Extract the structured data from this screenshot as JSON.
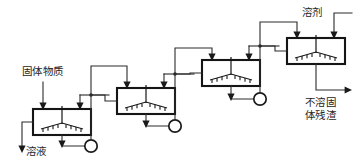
{
  "diagram": {
    "type": "process-flow-diagram",
    "background_color": "#ffffff",
    "line_color": "#2b2b2b",
    "vessel_stroke_color": "#151515",
    "text_color": "#242424",
    "labels": [
      {
        "id": "solid-feed",
        "text": "固体物质",
        "meaning": "solid material feed",
        "x": 22,
        "y": 72,
        "align": "left"
      },
      {
        "id": "solution-out",
        "text": "溶液",
        "meaning": "solution outlet",
        "x": 26,
        "y": 152,
        "align": "left"
      },
      {
        "id": "solvent-in",
        "text": "溶剂",
        "meaning": "solvent inlet",
        "x": 302,
        "y": 15,
        "align": "left"
      },
      {
        "id": "residue-out-line1",
        "text": "不溶固",
        "meaning": "insoluble solid",
        "x": 305,
        "y": 102,
        "align": "left"
      },
      {
        "id": "residue-out-line2",
        "text": "体残渣",
        "meaning": "residue",
        "x": 305,
        "y": 115,
        "align": "left"
      }
    ],
    "stages": [
      {
        "id": "stage-1",
        "index": 1,
        "name": "leaching-vessel-1",
        "x": 33,
        "y": 109,
        "width": 58,
        "height": 26,
        "pump": {
          "id": "pump-1",
          "cx": 91,
          "cy": 146,
          "r": 6.2
        }
      },
      {
        "id": "stage-2",
        "index": 2,
        "name": "leaching-vessel-2",
        "x": 117,
        "y": 88,
        "width": 58,
        "height": 26,
        "pump": {
          "id": "pump-2",
          "cx": 175,
          "cy": 126,
          "r": 6.2
        }
      },
      {
        "id": "stage-3",
        "index": 3,
        "name": "leaching-vessel-3",
        "x": 202,
        "y": 60,
        "width": 58,
        "height": 26,
        "pump": {
          "id": "pump-3",
          "cx": 260,
          "cy": 99,
          "r": 6.2
        }
      },
      {
        "id": "stage-4",
        "index": 4,
        "name": "leaching-vessel-4",
        "x": 287,
        "y": 38,
        "width": 58,
        "height": 26,
        "pump": {
          "id": "pump-4",
          "cx": 0,
          "cy": 0,
          "r": 0
        }
      }
    ],
    "stream_count": 4,
    "pump_count": 3
  }
}
